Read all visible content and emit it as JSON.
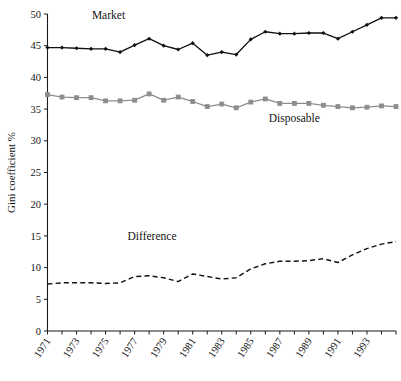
{
  "chart_data": {
    "type": "line",
    "title": "",
    "xlabel": "",
    "ylabel": "Gini coefficient  %",
    "ylim": [
      0,
      50
    ],
    "ytick_step": 5,
    "yticks": [
      0,
      5,
      10,
      15,
      20,
      25,
      30,
      35,
      40,
      45,
      50
    ],
    "xlim": [
      1971,
      1995
    ],
    "x": [
      1971,
      1972,
      1973,
      1974,
      1975,
      1976,
      1977,
      1978,
      1979,
      1980,
      1981,
      1982,
      1983,
      1984,
      1985,
      1986,
      1987,
      1988,
      1989,
      1990,
      1991,
      1992,
      1993,
      1994,
      1995
    ],
    "xticks": [
      1971,
      1972,
      1973,
      1974,
      1975,
      1976,
      1977,
      1978,
      1979,
      1980,
      1981,
      1982,
      1983,
      1984,
      1985,
      1986,
      1987,
      1988,
      1989,
      1990,
      1991,
      1992,
      1993,
      1994,
      1995
    ],
    "xtick_labels": [
      "1971",
      "",
      "1973",
      "",
      "1975",
      "",
      "1977",
      "",
      "1979",
      "",
      "1981",
      "",
      "1983",
      "",
      "1985",
      "",
      "1987",
      "",
      "1989",
      "",
      "1991",
      "",
      "1993",
      "",
      ""
    ],
    "grid": false,
    "legend_position": "inline-annotations",
    "series": [
      {
        "name": "Market",
        "color": "#111111",
        "style": "solid",
        "marker": "diamond",
        "label_x": 1975.2,
        "label_y": 49.2,
        "values": [
          44.7,
          44.7,
          44.6,
          44.5,
          44.5,
          44.0,
          45.1,
          46.1,
          45.0,
          44.4,
          45.4,
          43.5,
          44.0,
          43.6,
          46.0,
          47.2,
          46.9,
          46.9,
          47.0,
          47.0,
          46.1,
          47.2,
          48.3,
          49.4,
          49.4
        ]
      },
      {
        "name": "Disposable",
        "color": "#8d8d8d",
        "style": "solid",
        "marker": "square",
        "label_x": 1988.0,
        "label_y": 33.0,
        "values": [
          37.3,
          36.9,
          36.8,
          36.8,
          36.3,
          36.3,
          36.4,
          37.4,
          36.4,
          36.9,
          36.2,
          35.4,
          35.8,
          35.2,
          36.1,
          36.6,
          35.9,
          35.9,
          35.9,
          35.6,
          35.4,
          35.2,
          35.3,
          35.5,
          35.4
        ]
      },
      {
        "name": "Difference",
        "color": "#111111",
        "style": "dashed",
        "marker": "none",
        "label_x": 1978.2,
        "label_y": 14.3,
        "values": [
          7.4,
          7.6,
          7.6,
          7.6,
          7.5,
          7.6,
          8.6,
          8.7,
          8.4,
          7.8,
          9.0,
          8.6,
          8.2,
          8.4,
          9.8,
          10.6,
          11.0,
          11.0,
          11.1,
          11.4,
          10.8,
          12.0,
          13.0,
          13.7,
          14.1
        ]
      }
    ]
  }
}
